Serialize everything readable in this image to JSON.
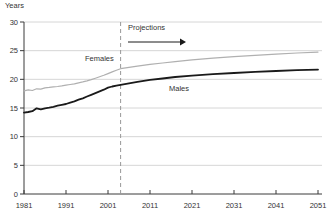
{
  "title": "Years",
  "annotations": {
    "females": "Females",
    "males": "Males",
    "projections": "Projections"
  },
  "colors": {
    "background": "#ffffff",
    "grid": "#cccccc",
    "axis": "#3a3a3a",
    "text": "#333333",
    "projection_divider": "#999999",
    "females_line": "#b0b0b0",
    "males_line": "#1a1a1a"
  },
  "chart_data": {
    "type": "line",
    "title": "",
    "xlabel": "",
    "ylabel": "Years",
    "xlim": [
      1981,
      2051
    ],
    "ylim": [
      0,
      30
    ],
    "x_ticks": [
      1981,
      1991,
      2001,
      2011,
      2021,
      2031,
      2041,
      2051
    ],
    "y_ticks": [
      0,
      5,
      10,
      15,
      20,
      25,
      30
    ],
    "grid": "horizontal",
    "legend_position": "inline-labels",
    "projection_start_year": 2004,
    "series": [
      {
        "name": "Females",
        "color": "#b0b0b0",
        "width": 1.2,
        "points": [
          [
            1981,
            18.0
          ],
          [
            1982,
            18.15
          ],
          [
            1983,
            18.05
          ],
          [
            1984,
            18.35
          ],
          [
            1985,
            18.3
          ],
          [
            1986,
            18.5
          ],
          [
            1987,
            18.6
          ],
          [
            1988,
            18.7
          ],
          [
            1989,
            18.75
          ],
          [
            1990,
            18.85
          ],
          [
            1991,
            19.0
          ],
          [
            1992,
            19.1
          ],
          [
            1993,
            19.2
          ],
          [
            1994,
            19.4
          ],
          [
            1995,
            19.55
          ],
          [
            1996,
            19.75
          ],
          [
            1997,
            19.95
          ],
          [
            1998,
            20.2
          ],
          [
            1999,
            20.45
          ],
          [
            2000,
            20.7
          ],
          [
            2001,
            21.0
          ],
          [
            2002,
            21.3
          ],
          [
            2003,
            21.6
          ],
          [
            2004,
            21.85
          ],
          [
            2006,
            22.1
          ],
          [
            2008,
            22.3
          ],
          [
            2011,
            22.6
          ],
          [
            2014,
            22.85
          ],
          [
            2017,
            23.1
          ],
          [
            2021,
            23.4
          ],
          [
            2026,
            23.7
          ],
          [
            2031,
            23.95
          ],
          [
            2036,
            24.2
          ],
          [
            2041,
            24.4
          ],
          [
            2046,
            24.6
          ],
          [
            2051,
            24.75
          ]
        ]
      },
      {
        "name": "Males",
        "color": "#1a1a1a",
        "width": 1.8,
        "points": [
          [
            1981,
            14.2
          ],
          [
            1982,
            14.3
          ],
          [
            1983,
            14.45
          ],
          [
            1984,
            14.95
          ],
          [
            1985,
            14.75
          ],
          [
            1986,
            14.95
          ],
          [
            1987,
            15.05
          ],
          [
            1988,
            15.2
          ],
          [
            1989,
            15.4
          ],
          [
            1990,
            15.55
          ],
          [
            1991,
            15.7
          ],
          [
            1992,
            15.95
          ],
          [
            1993,
            16.15
          ],
          [
            1994,
            16.45
          ],
          [
            1995,
            16.7
          ],
          [
            1996,
            17.0
          ],
          [
            1997,
            17.3
          ],
          [
            1998,
            17.6
          ],
          [
            1999,
            17.9
          ],
          [
            2000,
            18.2
          ],
          [
            2001,
            18.55
          ],
          [
            2002,
            18.75
          ],
          [
            2003,
            18.9
          ],
          [
            2004,
            19.05
          ],
          [
            2006,
            19.3
          ],
          [
            2008,
            19.55
          ],
          [
            2011,
            19.9
          ],
          [
            2014,
            20.15
          ],
          [
            2017,
            20.4
          ],
          [
            2021,
            20.65
          ],
          [
            2026,
            20.9
          ],
          [
            2031,
            21.1
          ],
          [
            2036,
            21.3
          ],
          [
            2041,
            21.45
          ],
          [
            2046,
            21.6
          ],
          [
            2051,
            21.7
          ]
        ]
      }
    ]
  }
}
